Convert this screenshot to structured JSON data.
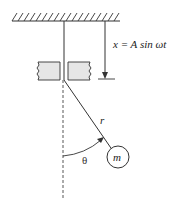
{
  "diagram": {
    "labels": {
      "displacement": "x = A sin ωt",
      "length": "r",
      "angle": "θ",
      "mass": "m"
    },
    "colors": {
      "line": "#333333",
      "block_fill": "#e6e6e6",
      "background": "#ffffff"
    }
  }
}
